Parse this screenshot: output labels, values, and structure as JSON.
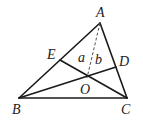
{
  "diagram": {
    "type": "geometry-triangle",
    "points": {
      "A": {
        "label": "A",
        "x": 100,
        "y": 23,
        "lx": 96,
        "ly": 17
      },
      "B": {
        "label": "B",
        "x": 19,
        "y": 98,
        "lx": 12,
        "ly": 114
      },
      "C": {
        "label": "C",
        "x": 127,
        "y": 98,
        "lx": 121,
        "ly": 114
      },
      "D": {
        "label": "D",
        "x": 116,
        "y": 67,
        "lx": 119,
        "ly": 66
      },
      "E": {
        "label": "E",
        "x": 60,
        "y": 60,
        "lx": 47,
        "ly": 59
      },
      "O": {
        "label": "O",
        "x": 87,
        "y": 78,
        "lx": 80,
        "ly": 94
      }
    },
    "angle_labels": {
      "a": {
        "label": "a",
        "x": 78,
        "y": 62
      },
      "b": {
        "label": "b",
        "x": 95,
        "y": 64
      }
    },
    "segments": [
      "AB",
      "BC",
      "CA",
      "BD",
      "CE"
    ],
    "dashed_segments": [
      "AO"
    ]
  }
}
